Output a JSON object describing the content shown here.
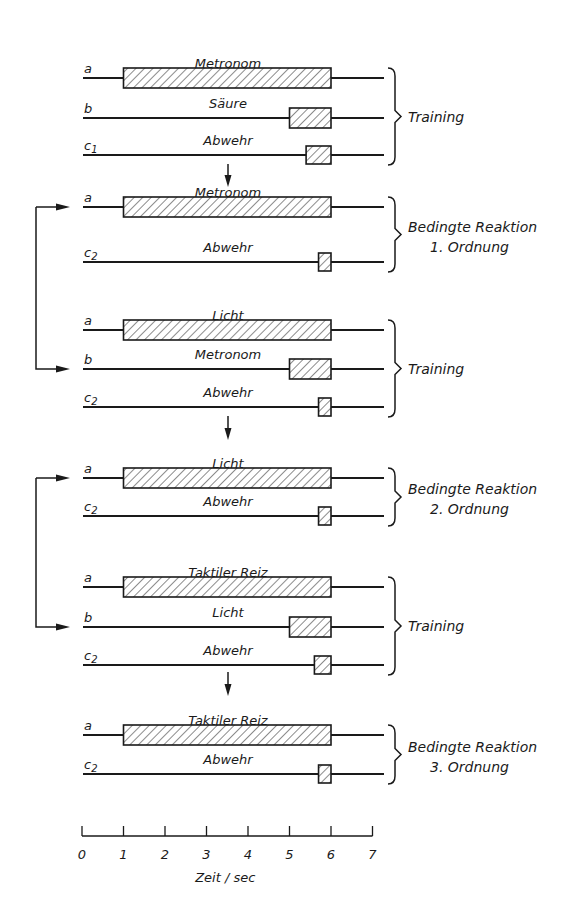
{
  "figure": {
    "axis": {
      "label": "Zeit / sec",
      "ticks": [
        "0",
        "1",
        "2",
        "3",
        "4",
        "5",
        "6",
        "7"
      ],
      "x0_px": 82,
      "px_per_sec": 41.5,
      "y_px": 836
    },
    "colors": {
      "ink": "#1a1a1a",
      "background": "#ffffff"
    },
    "blocks": [
      {
        "phase_lines": [
          "Training"
        ],
        "rows": [
          {
            "id": "a",
            "sub": "",
            "stimulus": "Metronom",
            "start": 1.0,
            "end": 6.0,
            "y": 78
          },
          {
            "id": "b",
            "sub": "",
            "stimulus": "Säure",
            "start": 5.0,
            "end": 6.0,
            "y": 118
          },
          {
            "id": "c",
            "sub": "1",
            "stimulus": "Abwehr",
            "start": 5.4,
            "end": 6.0,
            "y": 155
          }
        ]
      },
      {
        "phase_lines": [
          "Bedingte Reaktion",
          "1. Ordnung"
        ],
        "rows": [
          {
            "id": "a",
            "sub": "",
            "stimulus": "Metronom",
            "start": 1.0,
            "end": 6.0,
            "y": 207
          },
          {
            "id": "c",
            "sub": "2",
            "stimulus": "Abwehr",
            "start": 5.7,
            "end": 6.0,
            "y": 262
          }
        ]
      },
      {
        "phase_lines": [
          "Training"
        ],
        "rows": [
          {
            "id": "a",
            "sub": "",
            "stimulus": "Licht",
            "start": 1.0,
            "end": 6.0,
            "y": 330
          },
          {
            "id": "b",
            "sub": "",
            "stimulus": "Metronom",
            "start": 5.0,
            "end": 6.0,
            "y": 369
          },
          {
            "id": "c",
            "sub": "2",
            "stimulus": "Abwehr",
            "start": 5.7,
            "end": 6.0,
            "y": 407
          }
        ]
      },
      {
        "phase_lines": [
          "Bedingte Reaktion",
          "2. Ordnung"
        ],
        "rows": [
          {
            "id": "a",
            "sub": "",
            "stimulus": "Licht",
            "start": 1.0,
            "end": 6.0,
            "y": 478
          },
          {
            "id": "c",
            "sub": "2",
            "stimulus": "Abwehr",
            "start": 5.7,
            "end": 6.0,
            "y": 516
          }
        ]
      },
      {
        "phase_lines": [
          "Training"
        ],
        "rows": [
          {
            "id": "a",
            "sub": "",
            "stimulus": "Taktiler Reiz",
            "start": 1.0,
            "end": 6.0,
            "y": 587
          },
          {
            "id": "b",
            "sub": "",
            "stimulus": "Licht",
            "start": 5.0,
            "end": 6.0,
            "y": 627
          },
          {
            "id": "c",
            "sub": "2",
            "stimulus": "Abwehr",
            "start": 5.6,
            "end": 6.0,
            "y": 665
          }
        ]
      },
      {
        "phase_lines": [
          "Bedingte Reaktion",
          "3. Ordnung"
        ],
        "rows": [
          {
            "id": "a",
            "sub": "",
            "stimulus": "Taktiler Reiz",
            "start": 1.0,
            "end": 6.0,
            "y": 735
          },
          {
            "id": "c",
            "sub": "2",
            "stimulus": "Abwehr",
            "start": 5.7,
            "end": 6.0,
            "y": 774
          }
        ]
      }
    ],
    "down_arrows": [
      {
        "x": 228,
        "y1": 164,
        "y2": 187
      },
      {
        "x": 228,
        "y1": 416,
        "y2": 440
      },
      {
        "x": 228,
        "y1": 672,
        "y2": 696
      }
    ],
    "feedback_arrows": [
      {
        "x": 36,
        "from_y": 369,
        "to_y": 207,
        "note": "Metronom (a, 1. Ordnung) wird b im nächsten Training"
      },
      {
        "x": 36,
        "from_y": 627,
        "to_y": 478,
        "note": "Licht (a, 2. Ordnung) wird b im nächsten Training"
      }
    ]
  }
}
